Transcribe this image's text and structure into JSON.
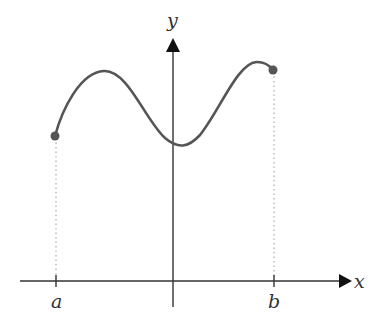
{
  "diagram": {
    "axes": {
      "x_label": "x",
      "y_label": "y"
    },
    "interval": {
      "left_label": "a",
      "right_label": "b"
    },
    "colors": {
      "axis": "#333333",
      "curve": "#555555",
      "endpoint": "#555555",
      "guide": "#888888"
    }
  }
}
